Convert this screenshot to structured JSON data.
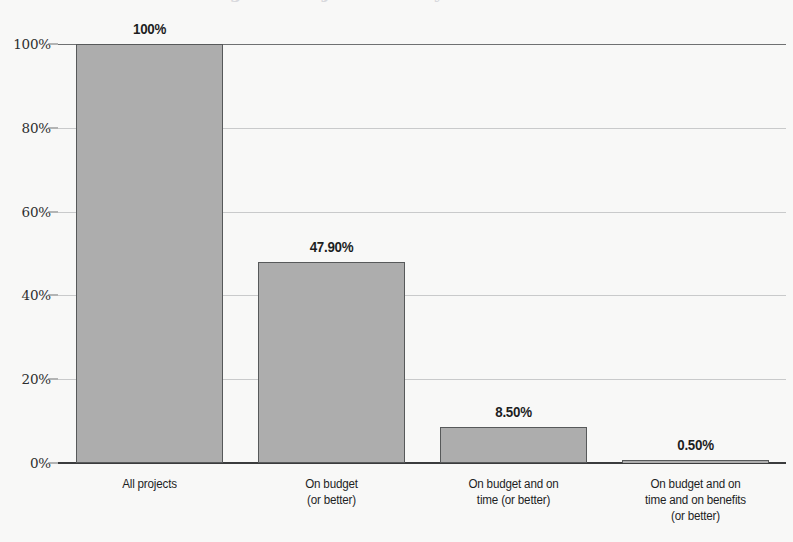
{
  "chart_data": {
    "type": "bar",
    "title": "",
    "xlabel": "",
    "ylabel": "",
    "categories": [
      "All projects",
      "On budget\n(or better)",
      "On budget and on\ntime (or better)",
      "On budget and on\ntime and on benefits\n(or better)"
    ],
    "values": [
      100,
      47.9,
      8.5,
      0.5
    ],
    "value_labels": [
      "100%",
      "47.90%",
      "8.50%",
      "0.50%"
    ],
    "ylim": [
      0,
      100
    ],
    "yticks": [
      0,
      20,
      40,
      60,
      80,
      100
    ],
    "ytick_labels": [
      "0%",
      "20%",
      "40%",
      "60%",
      "80%",
      "100%"
    ],
    "grid": "horizontal",
    "legend": "none",
    "series": [
      {
        "name": "Percentage of projects",
        "values": [
          100,
          47.9,
          8.5,
          0.5
        ]
      }
    ],
    "colors": {
      "bar_fill": "#adadad",
      "bar_border": "#57595a",
      "gridline": "#c9cacb",
      "axis": "#3b3c3d",
      "text": "#1d1e1f",
      "background": "#f8f8f7"
    }
  },
  "title_remnant": "Figure: Project delivery success rates"
}
